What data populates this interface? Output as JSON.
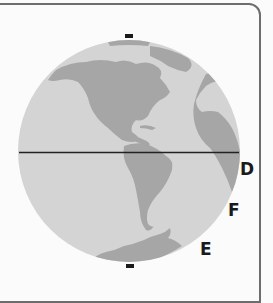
{
  "diagram": {
    "type": "globe-hemisphere",
    "colors": {
      "ocean": "#d4d4d4",
      "land": "#a6a6a6",
      "equator": "#222222",
      "pole_marker": "#1a1a1a",
      "frame": "#6d6d6d",
      "background": "#fbfbfb"
    },
    "features": [
      "north-america",
      "south-america",
      "antarctica",
      "africa-europe-edge",
      "equator-line",
      "north-pole-marker",
      "south-pole-marker"
    ],
    "labels": [
      {
        "id": "D",
        "text": "D"
      },
      {
        "id": "F",
        "text": "F"
      },
      {
        "id": "E",
        "text": "E"
      }
    ]
  }
}
